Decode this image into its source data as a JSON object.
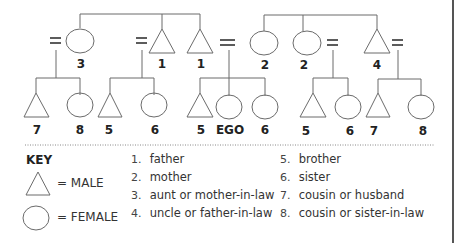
{
  "colors": {
    "line": "#6b6b6b",
    "text": "#222222",
    "border": "#555555"
  },
  "diagram": {
    "equals_symbol": "=",
    "parent_generation": [
      {
        "shape": "circle",
        "label": "3",
        "x": 80
      },
      {
        "shape": "triangle",
        "label": "1",
        "x": 162
      },
      {
        "shape": "triangle",
        "label": "1",
        "x": 200
      },
      {
        "shape": "circle",
        "label": "2",
        "x": 264
      },
      {
        "shape": "circle",
        "label": "2",
        "x": 307
      },
      {
        "shape": "triangle",
        "label": "4",
        "x": 377
      }
    ],
    "ego_generation": [
      {
        "shape": "triangle",
        "label": "7",
        "x": 36
      },
      {
        "shape": "circle",
        "label": "8",
        "x": 80
      },
      {
        "shape": "triangle",
        "label": "5",
        "x": 110
      },
      {
        "shape": "circle",
        "label": "6",
        "x": 154
      },
      {
        "shape": "triangle",
        "label": "5",
        "x": 200
      },
      {
        "shape": "circle",
        "label": "EGO",
        "x": 229
      },
      {
        "shape": "circle",
        "label": "6",
        "x": 265
      },
      {
        "shape": "triangle",
        "label": "5",
        "x": 313
      },
      {
        "shape": "circle",
        "label": "6",
        "x": 348
      },
      {
        "shape": "triangle",
        "label": "7",
        "x": 378
      },
      {
        "shape": "circle",
        "label": "8",
        "x": 421
      }
    ]
  },
  "key": {
    "title": "KEY",
    "male_label": "= MALE",
    "female_label": "= FEMALE",
    "items": [
      {
        "num": "1.",
        "text": "father"
      },
      {
        "num": "2.",
        "text": "mother"
      },
      {
        "num": "3.",
        "text": "aunt or mother-in-law"
      },
      {
        "num": "4.",
        "text": "uncle or father-in-law"
      },
      {
        "num": "5.",
        "text": "brother"
      },
      {
        "num": "6.",
        "text": "sister"
      },
      {
        "num": "7.",
        "text": "cousin or husband"
      },
      {
        "num": "8.",
        "text": "cousin or sister-in-law"
      }
    ]
  }
}
